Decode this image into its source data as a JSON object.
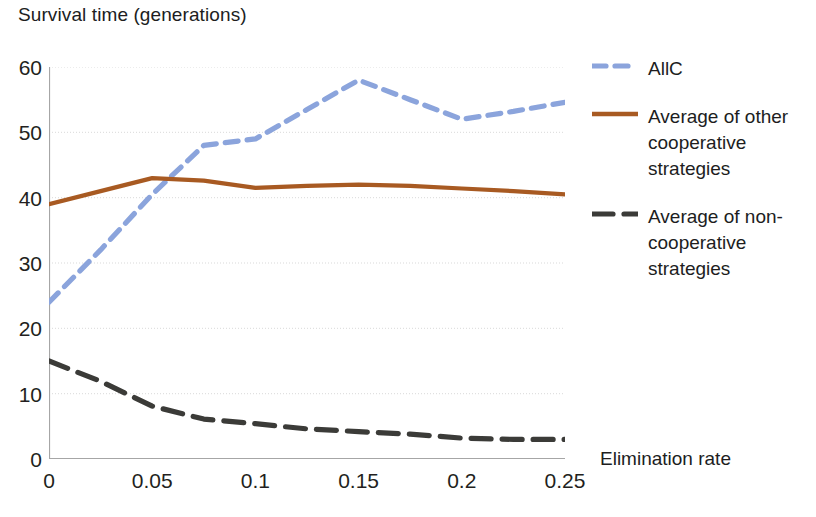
{
  "chart_data": {
    "type": "line",
    "title": "Survival time (generations)",
    "xlabel": "Elimination rate",
    "ylabel": "Survival time (generations)",
    "xlim": [
      0,
      0.25
    ],
    "ylim": [
      0,
      60
    ],
    "grid": true,
    "legend_position": "right",
    "x": [
      0,
      0.025,
      0.05,
      0.075,
      0.1,
      0.125,
      0.15,
      0.175,
      0.2,
      0.225,
      0.25
    ],
    "x_tick_labels": [
      "0",
      "0.05",
      "0.1",
      "0.15",
      "0.2",
      "0.25"
    ],
    "x_tick_values": [
      0,
      0.05,
      0.1,
      0.15,
      0.2,
      0.25
    ],
    "y_tick_labels": [
      "0",
      "10",
      "20",
      "30",
      "40",
      "50",
      "60"
    ],
    "y_tick_values": [
      0,
      10,
      20,
      30,
      40,
      50,
      60
    ],
    "series": [
      {
        "name": "AllC",
        "color": "#8BA4DC",
        "style": "dashed",
        "values": [
          24,
          32,
          40.5,
          48,
          49,
          53.5,
          58,
          55,
          52,
          53.2,
          54.6
        ]
      },
      {
        "name": "Average of other cooperative strategies",
        "color": "#A85A22",
        "style": "solid",
        "values": [
          39,
          41,
          43,
          42.6,
          41.5,
          41.8,
          42,
          41.8,
          41.4,
          41,
          40.5
        ]
      },
      {
        "name": "Average of non-cooperative strategies",
        "color": "#3B3B38",
        "style": "dashed",
        "values": [
          15,
          11.9,
          8.1,
          6.1,
          5.4,
          4.6,
          4.2,
          3.8,
          3.2,
          3.0,
          3.0
        ]
      }
    ]
  },
  "chart": {
    "title": "Survival time (generations)",
    "x_axis_title": "Elimination rate"
  },
  "legend": {
    "entries": [
      {
        "label": "AllC"
      },
      {
        "label": "Average of other cooperative strategies"
      },
      {
        "label": "Average of non-cooperative strategies"
      }
    ]
  }
}
